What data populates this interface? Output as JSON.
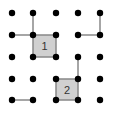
{
  "game": {
    "type": "dots-and-boxes",
    "grid": {
      "cols": 5,
      "rows": 5
    },
    "dot_x": [
      12,
      33,
      56,
      78,
      100
    ],
    "dot_y": [
      13,
      35,
      57,
      79,
      100
    ],
    "colors": {
      "dot": "#000000",
      "line": "#888888",
      "box_fill": "#d0d0d0"
    },
    "lines": [
      {
        "from": [
          1,
          0
        ],
        "to": [
          1,
          1
        ]
      },
      {
        "from": [
          0,
          1
        ],
        "to": [
          1,
          1
        ]
      },
      {
        "from": [
          3,
          1
        ],
        "to": [
          4,
          1
        ]
      },
      {
        "from": [
          4,
          0
        ],
        "to": [
          4,
          1
        ]
      },
      {
        "from": [
          3,
          2
        ],
        "to": [
          3,
          3
        ]
      },
      {
        "from": [
          0,
          4
        ],
        "to": [
          1,
          4
        ]
      }
    ],
    "boxes": [
      {
        "col": 1,
        "row": 1,
        "label": "1"
      },
      {
        "col": 2,
        "row": 3,
        "label": "2"
      }
    ]
  }
}
